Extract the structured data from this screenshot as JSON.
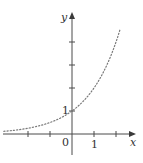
{
  "chart_data": {
    "type": "line",
    "title": "",
    "function": "y = 2^x",
    "xlabel": "x",
    "ylabel": "y",
    "xlim": [
      -3.1,
      2.85
    ],
    "ylim": [
      -0.9,
      5.2
    ],
    "x_ticks": [
      -2,
      -1,
      1,
      2
    ],
    "y_ticks": [
      1,
      2,
      3,
      4
    ],
    "labels": {
      "origin": "0",
      "x_one": "1",
      "y_one": "1",
      "x_axis": "x",
      "y_axis": "y"
    },
    "style": {
      "curve": "dotted",
      "grid": false,
      "curve_color": "#7a7a7a",
      "axis_color": "#4a4a4a"
    },
    "series": [
      {
        "name": "y = 2^x",
        "x": [
          -3.1,
          -2.5,
          -2,
          -1.5,
          -1,
          -0.5,
          0,
          0.5,
          1,
          1.5,
          2,
          2.2
        ],
        "y": [
          0.117,
          0.177,
          0.25,
          0.354,
          0.5,
          0.707,
          1,
          1.414,
          2,
          2.828,
          4,
          4.595
        ]
      }
    ]
  }
}
